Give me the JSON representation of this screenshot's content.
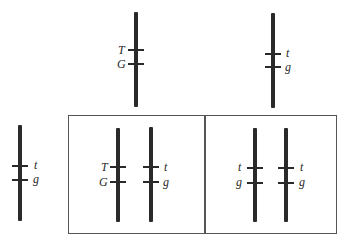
{
  "diagram": {
    "type": "genetic-cross-chromosomes",
    "colors": {
      "chromosome": "#2a2a2a",
      "box": "#555555",
      "background": "#ffffff"
    },
    "parents": [
      {
        "id": "parent-dominant",
        "loci": [
          {
            "label": "T"
          },
          {
            "label": "G"
          }
        ]
      },
      {
        "id": "parent-recessive",
        "loci": [
          {
            "label": "t"
          },
          {
            "label": "g"
          }
        ]
      }
    ],
    "tester": {
      "id": "tester",
      "loci": [
        {
          "label": "t"
        },
        {
          "label": "g"
        }
      ]
    },
    "offspring": [
      {
        "id": "offspring-heterozygous",
        "chromosomes": [
          {
            "loci": [
              {
                "label": "T"
              },
              {
                "label": "G"
              }
            ]
          },
          {
            "loci": [
              {
                "label": "t"
              },
              {
                "label": "g"
              }
            ]
          }
        ]
      },
      {
        "id": "offspring-homozygous",
        "chromosomes": [
          {
            "loci": [
              {
                "label": "t"
              },
              {
                "label": "g"
              }
            ]
          },
          {
            "loci": [
              {
                "label": "t"
              },
              {
                "label": "g"
              }
            ]
          }
        ]
      }
    ]
  }
}
